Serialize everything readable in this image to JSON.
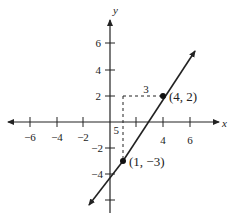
{
  "figure": {
    "type": "coordinate-plane-line",
    "axes": {
      "x_label": "x",
      "y_label": "y",
      "x_ticks": [
        {
          "value": -6,
          "label": "−6"
        },
        {
          "value": -4,
          "label": "−4"
        },
        {
          "value": -2,
          "label": "−2"
        },
        {
          "value": 2,
          "label": ""
        },
        {
          "value": 4,
          "label": "4"
        },
        {
          "value": 6,
          "label": "6"
        }
      ],
      "y_ticks": [
        {
          "value": 6,
          "label": "6"
        },
        {
          "value": 4,
          "label": "4"
        },
        {
          "value": 2,
          "label": "2"
        },
        {
          "value": -2,
          "label": "−2"
        },
        {
          "value": -4,
          "label": "−4"
        },
        {
          "value": -6,
          "label": ""
        }
      ]
    },
    "points": [
      {
        "x": 4,
        "y": 2,
        "label": "(4, 2)"
      },
      {
        "x": 1,
        "y": -3,
        "label": "(1, −3)"
      }
    ],
    "line": {
      "through": [
        [
          1,
          -3
        ],
        [
          4,
          2
        ]
      ],
      "slope": "5/3"
    },
    "slope_triangle": {
      "run_label": "3",
      "rise_label": "5"
    },
    "colors": {
      "ink": "#222222",
      "background": "#ffffff"
    }
  }
}
